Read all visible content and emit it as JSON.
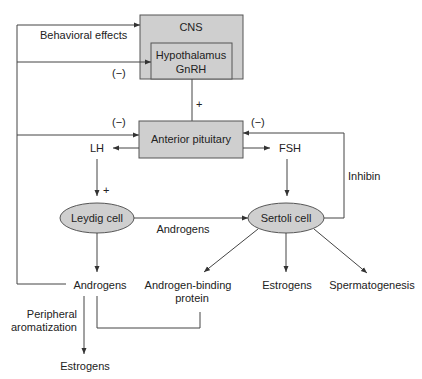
{
  "diagram": {
    "colors": {
      "box_fill": "#cfcfcf",
      "stroke": "#444444",
      "text": "#222222"
    },
    "nodes": {
      "cns": "CNS",
      "hypothalamus": "Hypothalamus",
      "gnrh": "GnRH",
      "anterior_pituitary": "Anterior pituitary",
      "lh": "LH",
      "fsh": "FSH",
      "leydig": "Leydig cell",
      "sertoli": "Sertoli cell",
      "androgens_out": "Androgens",
      "abp_line1": "Androgen-binding",
      "abp_line2": "protein",
      "estrogens_sertoli": "Estrogens",
      "spermatogenesis": "Spermatogenesis",
      "estrogens_peripheral": "Estrogens"
    },
    "edge_labels": {
      "behavioral": "Behavioral effects",
      "neg_hypothalamus": "(−)",
      "neg_pituitary_left": "(−)",
      "neg_pituitary_right": "(−)",
      "plus_gnrh": "+",
      "plus_lh": "+",
      "androgens_edge": "Androgens",
      "inhibin": "Inhibin",
      "peripheral_line1": "Peripheral",
      "peripheral_line2": "aromatization"
    }
  }
}
